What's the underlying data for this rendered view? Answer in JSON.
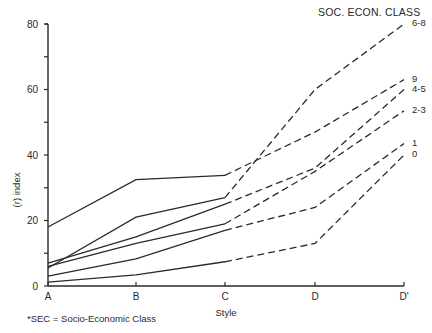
{
  "chart_data": {
    "type": "line",
    "title": "",
    "legend_title": "SOC. ECON. CLASS",
    "xlabel": "Style",
    "ylabel": "(r) index",
    "categories": [
      "A",
      "B",
      "C",
      "D",
      "D'"
    ],
    "ylim": [
      0,
      80
    ],
    "y_ticks": [
      0,
      20,
      40,
      60,
      80
    ],
    "y_minor_ticks": [
      10,
      30,
      50,
      70
    ],
    "grid": false,
    "legend_position": "right, labels at line ends",
    "solid_segment_range": [
      "A",
      "C"
    ],
    "dashed_segment_range": [
      "C",
      "D'"
    ],
    "series": [
      {
        "name": "6-8",
        "values": [
          5.5,
          21,
          27,
          60,
          80
        ]
      },
      {
        "name": "9",
        "values": [
          18,
          32.5,
          33.8,
          47,
          63
        ]
      },
      {
        "name": "4-5",
        "values": [
          7,
          15,
          25,
          36,
          60
        ]
      },
      {
        "name": "2-3",
        "values": [
          6,
          13,
          19,
          35,
          53.5
        ]
      },
      {
        "name": "1",
        "values": [
          3,
          8.3,
          17,
          24,
          43.5
        ]
      },
      {
        "name": "0",
        "values": [
          1.2,
          3.4,
          7.4,
          13,
          40
        ]
      }
    ],
    "footnote": "*SEC = Socio-Economic Class"
  }
}
